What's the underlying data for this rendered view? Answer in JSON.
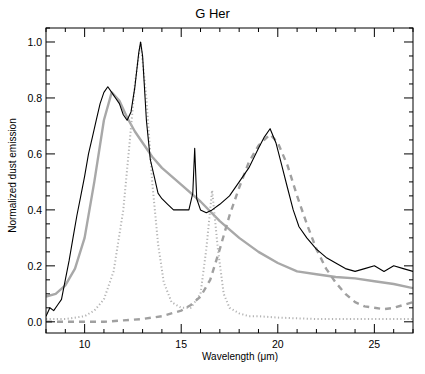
{
  "chart_data": {
    "type": "line",
    "title": "G Her",
    "xlabel": "Wavelength (μm)",
    "ylabel": "Normalized dust emission",
    "xlim": [
      8,
      27
    ],
    "ylim": [
      -0.04,
      1.05
    ],
    "xticks": [
      10,
      15,
      20,
      25
    ],
    "yticks": [
      0.0,
      0.2,
      0.4,
      0.6,
      0.8,
      1.0
    ],
    "xtick_labels": [
      "10",
      "15",
      "20",
      "25"
    ],
    "ytick_labels": [
      "0.0",
      "0.2",
      "0.4",
      "0.6",
      "0.8",
      "1.0"
    ],
    "grid": false,
    "legend": null,
    "series": [
      {
        "name": "Observed spectrum",
        "style": "solid-black",
        "color": "#000000",
        "x": [
          8.0,
          8.2,
          8.4,
          8.6,
          8.8,
          9.0,
          9.2,
          9.4,
          9.6,
          9.8,
          10.0,
          10.2,
          10.4,
          10.6,
          10.8,
          11.0,
          11.2,
          11.4,
          11.6,
          11.8,
          12.0,
          12.2,
          12.4,
          12.6,
          12.8,
          12.9,
          13.0,
          13.2,
          13.4,
          13.6,
          13.8,
          14.0,
          14.3,
          14.6,
          15.0,
          15.4,
          15.6,
          15.7,
          15.8,
          16.0,
          16.3,
          16.6,
          17.0,
          17.5,
          18.0,
          18.5,
          19.0,
          19.3,
          19.6,
          19.9,
          20.2,
          20.5,
          20.8,
          21.1,
          21.5,
          22.0,
          22.5,
          23.0,
          23.5,
          24.0,
          24.5,
          25.0,
          25.5,
          26.0,
          26.5,
          27.0
        ],
        "y": [
          0.02,
          0.05,
          0.04,
          0.06,
          0.08,
          0.15,
          0.22,
          0.3,
          0.38,
          0.45,
          0.52,
          0.6,
          0.66,
          0.72,
          0.78,
          0.82,
          0.84,
          0.82,
          0.8,
          0.78,
          0.74,
          0.72,
          0.75,
          0.84,
          0.96,
          1.0,
          0.95,
          0.72,
          0.58,
          0.52,
          0.46,
          0.44,
          0.42,
          0.4,
          0.4,
          0.4,
          0.46,
          0.62,
          0.44,
          0.4,
          0.39,
          0.4,
          0.42,
          0.45,
          0.5,
          0.55,
          0.62,
          0.66,
          0.69,
          0.64,
          0.56,
          0.48,
          0.4,
          0.34,
          0.3,
          0.26,
          0.23,
          0.21,
          0.19,
          0.18,
          0.19,
          0.2,
          0.18,
          0.2,
          0.19,
          0.18
        ]
      },
      {
        "name": "Continuum component",
        "style": "solid-gray",
        "color": "#aaaaaa",
        "x": [
          8.0,
          8.5,
          9.0,
          9.5,
          10.0,
          10.5,
          11.0,
          11.4,
          11.8,
          12.2,
          12.6,
          13.0,
          13.5,
          14.0,
          15.0,
          16.0,
          17.0,
          18.0,
          19.0,
          20.0,
          21.0,
          22.0,
          23.0,
          24.0,
          25.0,
          26.0,
          27.0
        ],
        "y": [
          0.09,
          0.1,
          0.13,
          0.19,
          0.3,
          0.5,
          0.72,
          0.82,
          0.79,
          0.73,
          0.68,
          0.64,
          0.59,
          0.55,
          0.49,
          0.43,
          0.36,
          0.3,
          0.25,
          0.21,
          0.18,
          0.17,
          0.16,
          0.155,
          0.145,
          0.135,
          0.12
        ]
      },
      {
        "name": "11-13 μm / 16.6 μm feature",
        "style": "dotted-gray",
        "color": "#b0b0b0",
        "x": [
          8.0,
          9.0,
          10.0,
          10.5,
          11.0,
          11.5,
          12.0,
          12.3,
          12.6,
          12.9,
          13.2,
          13.5,
          13.8,
          14.1,
          14.5,
          15.0,
          15.5,
          16.0,
          16.3,
          16.6,
          16.9,
          17.2,
          17.5,
          18.0,
          18.5,
          19.0,
          20.0,
          22.0,
          24.0,
          26.0,
          27.0
        ],
        "y": [
          0.01,
          0.01,
          0.02,
          0.04,
          0.08,
          0.18,
          0.4,
          0.62,
          0.85,
          1.0,
          0.8,
          0.5,
          0.28,
          0.14,
          0.07,
          0.05,
          0.05,
          0.1,
          0.26,
          0.47,
          0.26,
          0.1,
          0.05,
          0.03,
          0.02,
          0.02,
          0.015,
          0.01,
          0.01,
          0.01,
          0.01
        ]
      },
      {
        "name": "20 μm feature",
        "style": "dashed-gray",
        "color": "#a0a0a0",
        "x": [
          8.0,
          9.0,
          10.0,
          11.0,
          12.0,
          13.0,
          14.0,
          15.0,
          15.5,
          16.0,
          16.5,
          17.0,
          17.5,
          18.0,
          18.5,
          19.0,
          19.6,
          20.0,
          20.5,
          21.0,
          21.5,
          22.0,
          22.5,
          23.0,
          23.5,
          24.0,
          24.5,
          25.0,
          25.5,
          26.0,
          26.5,
          27.0
        ],
        "y": [
          0.0,
          0.0,
          0.0,
          0.0,
          0.005,
          0.01,
          0.02,
          0.04,
          0.06,
          0.09,
          0.15,
          0.26,
          0.38,
          0.48,
          0.57,
          0.63,
          0.67,
          0.64,
          0.56,
          0.45,
          0.35,
          0.26,
          0.19,
          0.14,
          0.1,
          0.07,
          0.055,
          0.05,
          0.045,
          0.05,
          0.06,
          0.07
        ]
      }
    ]
  },
  "axes": {
    "plot_px": {
      "left": 46,
      "right": 413,
      "top": 28,
      "bottom": 333
    }
  }
}
